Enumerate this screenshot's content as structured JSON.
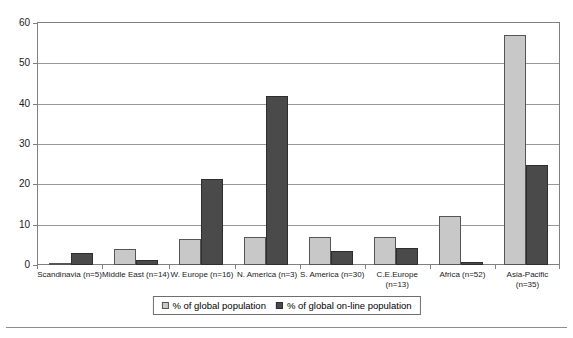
{
  "chart_data": {
    "type": "bar",
    "title": "",
    "subtitle": "",
    "xlabel": "",
    "ylabel": "",
    "ylim": [
      0,
      60
    ],
    "yticks": [
      0,
      10,
      20,
      30,
      40,
      50,
      60
    ],
    "ytick_labels": [
      "0",
      "10",
      "20",
      "30",
      "40",
      "50",
      "60"
    ],
    "grid": true,
    "grid_axis": "y",
    "legend_position": "bottom-center",
    "categories": [
      "Scandinavia (n=5)",
      "Middle East (n=14)",
      "W. Europe  (n=16)",
      "N. America  (n=3)",
      "S. America  (n=30)",
      "C.E.Europe (n=13)",
      "Africa      (n=52)",
      "Asia-Pacific (n=35)"
    ],
    "category_lines": [
      [
        "Scandinavia (n=5)"
      ],
      [
        "Middle East (n=14)"
      ],
      [
        "W. Europe  (n=16)"
      ],
      [
        "N. America  (n=3)"
      ],
      [
        "S. America  (n=30)"
      ],
      [
        "C.E.Europe",
        "(n=13)"
      ],
      [
        "Africa      (n=52)"
      ],
      [
        "Asia-Pacific",
        "(n=35)"
      ]
    ],
    "series": [
      {
        "name": "% of global population",
        "color": "#c8c8c8",
        "values": [
          0.5,
          4.0,
          6.5,
          7.0,
          7.0,
          7.0,
          12.2,
          57.0
        ]
      },
      {
        "name": "% of global on-line population",
        "color": "#4a4a4a",
        "values": [
          3.0,
          1.3,
          21.3,
          41.8,
          3.4,
          4.2,
          0.8,
          24.7
        ]
      }
    ]
  },
  "legend": {
    "entries": [
      {
        "label": "% of global population"
      },
      {
        "label": "% of global on-line population"
      }
    ]
  },
  "colors": {
    "series_a": "#c8c8c8",
    "series_b": "#4a4a4a",
    "gridline": "#999999",
    "frame": "#808080"
  }
}
